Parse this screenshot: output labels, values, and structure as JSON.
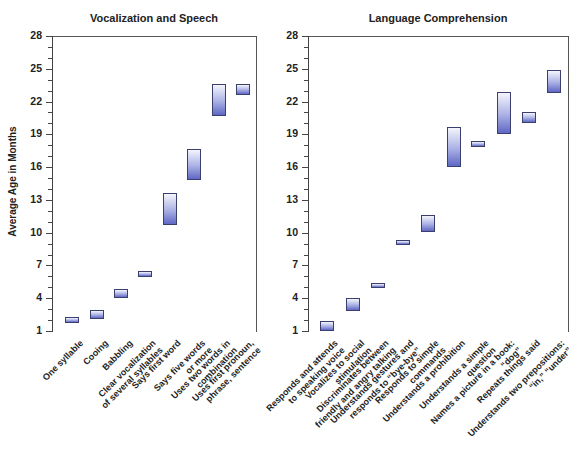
{
  "chart_data": [
    {
      "type": "bar",
      "subtype": "floating-range",
      "title": "Vocalization and Speech",
      "ylabel": "Average Age in Months",
      "xlabel": "",
      "ylim": [
        1,
        28
      ],
      "yticks": [
        1,
        4,
        7,
        10,
        13,
        16,
        19,
        22,
        25,
        28
      ],
      "grid": false,
      "categories": [
        "One syllable",
        "Cooing",
        "Babbling",
        "Clear vocalization of several syllables",
        "Says first word",
        "Says five words or more",
        "Uses two words in combination",
        "Uses first pronoun, phrase, sentence"
      ],
      "series": [
        {
          "name": "low",
          "values": [
            1.7,
            2.1,
            4.0,
            5.9,
            10.7,
            14.8,
            20.7,
            22.6
          ]
        },
        {
          "name": "high",
          "values": [
            2.3,
            2.9,
            4.8,
            6.5,
            13.6,
            17.7,
            23.6,
            23.6
          ]
        }
      ]
    },
    {
      "type": "bar",
      "subtype": "floating-range",
      "title": "Language Comprehension",
      "ylabel": "",
      "xlabel": "",
      "ylim": [
        1,
        28
      ],
      "yticks": [
        1,
        4,
        7,
        10,
        13,
        16,
        19,
        22,
        25,
        28
      ],
      "grid": false,
      "categories": [
        "Responds and attends to speaking voice",
        "Vocalizes to social stimulation",
        "Discriminates between friendly and angry talking",
        "Understands gestures and responds to “bye-bye”",
        "Responds to simple commands",
        "Understands a prohibition",
        "Understands a simple question",
        "Names a picture in a book: “dog”",
        "Repeats things said",
        "Understands two prepositions: “in,” “under”"
      ],
      "series": [
        {
          "name": "low",
          "values": [
            1.0,
            2.8,
            5.0,
            8.9,
            10.1,
            16.0,
            17.8,
            19.0,
            20.0,
            22.8
          ]
        },
        {
          "name": "high",
          "values": [
            1.9,
            4.0,
            5.4,
            9.3,
            11.6,
            19.7,
            18.4,
            22.9,
            21.0,
            24.9
          ]
        }
      ]
    }
  ],
  "left": {
    "title": "Vocalization and Speech",
    "ylabel": "Average Age in Months",
    "yticks": [
      "28",
      "25",
      "22",
      "19",
      "16",
      "13",
      "10",
      "7",
      "4",
      "1"
    ],
    "labels": [
      "One syllable",
      "Cooing",
      "Babbling",
      "Clear vocalization\nof several syllables",
      "Says first word",
      "Says five words\nor more",
      "Uses two words in\ncombination",
      "Uses first pronoun,\nphrase, sentence"
    ]
  },
  "right": {
    "title": "Language Comprehension",
    "yticks": [
      "28",
      "25",
      "22",
      "19",
      "16",
      "13",
      "10",
      "7",
      "4",
      "1"
    ],
    "labels": [
      "Responds and attends\nto speaking voice",
      "Vocalizes to social\nstimulation",
      "Discriminates between\nfriendly and angry talking",
      "Understands gestures and\nresponds to “bye-bye”",
      "Responds to simple\ncommands",
      "Understands a prohibition",
      "Understands a simple\nquestion",
      "Names a picture in a book:\n“dog”",
      "Repeats things said",
      "Understands two prepositions:\n“in,” “under”"
    ]
  },
  "colors": {
    "bar_top": "#f4f5fc",
    "bar_bottom": "#5f68c4",
    "bar_border": "#3a3f6e",
    "axis": "#444444"
  }
}
